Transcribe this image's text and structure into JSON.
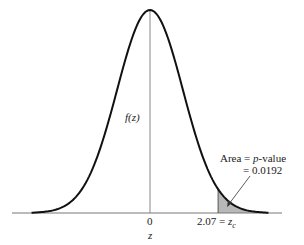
{
  "chart_data": {
    "type": "area",
    "title": "",
    "xlabel": "z",
    "ylabel": "f(z)",
    "distribution": "standard normal",
    "xlim": [
      -3.6,
      3.6
    ],
    "x_ticks": [
      {
        "value": 0,
        "label": "0"
      },
      {
        "value": 2.07,
        "label": "2.07 = z_c"
      }
    ],
    "shaded_region": {
      "from": 2.07,
      "to": 3.6,
      "tail": "right",
      "area": 0.0192
    },
    "annotation": {
      "line1": "Area = p-value",
      "line2": "= 0.0192"
    },
    "colors": {
      "curve": "#111111",
      "shade": "#b8b8b8",
      "axis": "#666666"
    }
  },
  "labels": {
    "y_axis": "f(z)",
    "x_axis": "z",
    "tick_zero": "0",
    "tick_crit_num": "2.07 = ",
    "tick_crit_var": "z",
    "tick_crit_sub": "c",
    "area_prefix": "Area = ",
    "area_p": "p",
    "area_suffix": "-value",
    "area_value": "= 0.0192"
  }
}
